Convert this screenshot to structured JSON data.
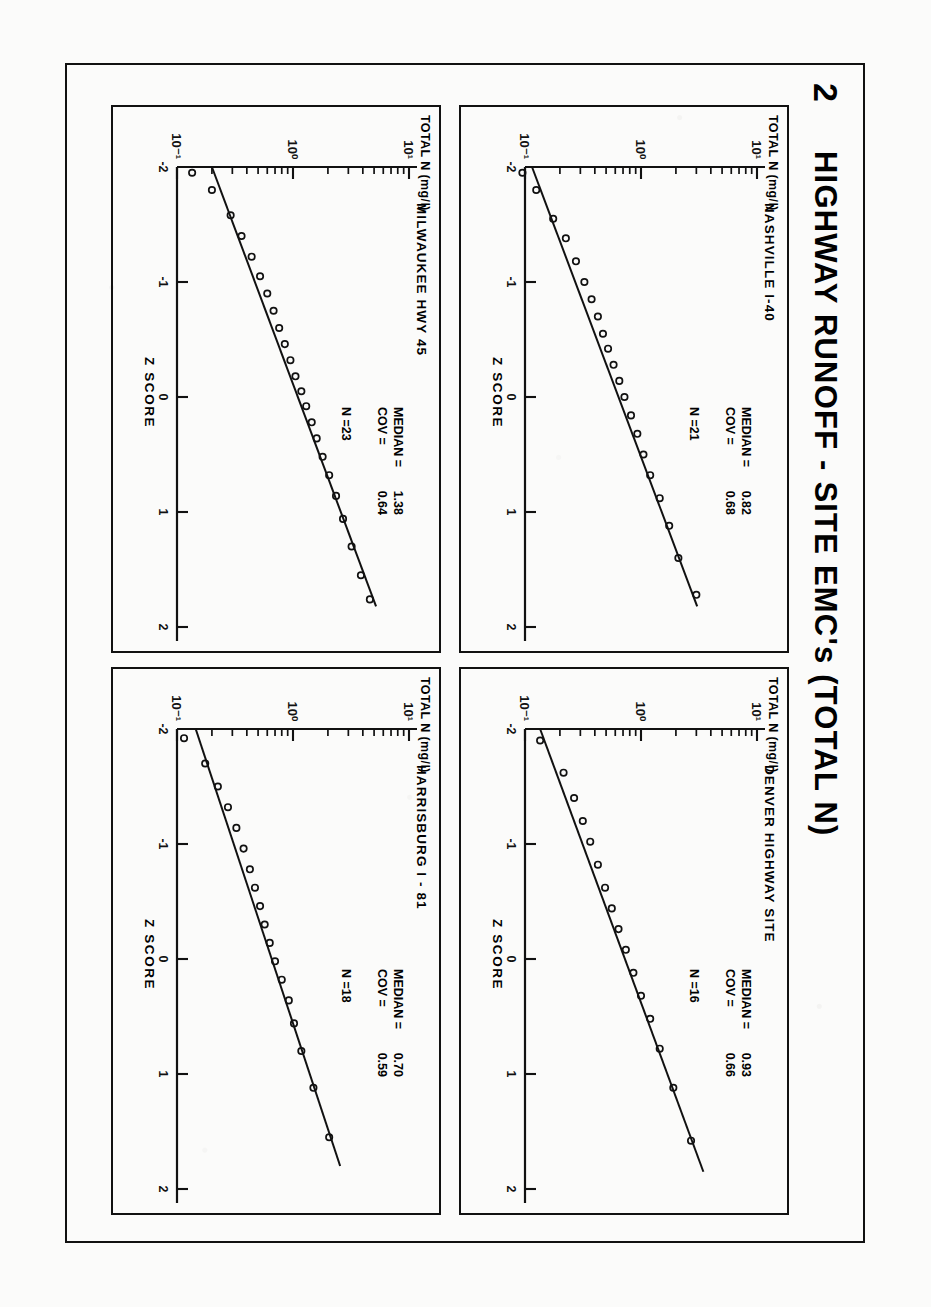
{
  "figure": {
    "number": "2",
    "title": "HIGHWAY RUNOFF  -  SITE EMC's   (TOTAL N)"
  },
  "axes": {
    "y_title": "TOTAL N",
    "y_units": "(mg/l)",
    "y_ticklabels": [
      "10¹",
      "10⁰",
      "10⁻¹"
    ],
    "x_title": "Z  SCORE",
    "x_ticklabels": [
      "-2",
      "-1",
      "0",
      "1",
      "2"
    ],
    "x_range": [
      -2,
      2
    ],
    "y_range_log10": [
      -1,
      1
    ],
    "y_scale": "log",
    "labels": {
      "median": "MEDIAN  =",
      "cov": "COV   =",
      "n_prefix": "N ="
    }
  },
  "panels": [
    {
      "id": "nashville",
      "position": "top-left-of-plate",
      "site": "NASHVILLE  I-40",
      "median": "0.82",
      "cov": "0.68",
      "n": "21",
      "chart_data": {
        "type": "scatter",
        "title": "NASHVILLE  I-40",
        "xlabel": "Z  SCORE",
        "ylabel": "TOTAL N (mg/l)",
        "xlim": [
          -2,
          2
        ],
        "ylim": [
          0.1,
          10
        ],
        "yscale": "log",
        "grid": false,
        "legend": null,
        "median": 0.82,
        "cov": 0.68,
        "n": 21,
        "fit_line": {
          "x": [
            -2.0,
            1.82
          ],
          "y": [
            0.115,
            3.05
          ]
        },
        "x": [
          -1.95,
          -1.8,
          -1.55,
          -1.38,
          -1.18,
          -1.0,
          -0.85,
          -0.7,
          -0.55,
          -0.42,
          -0.28,
          -0.14,
          0.0,
          0.16,
          0.32,
          0.5,
          0.68,
          0.88,
          1.12,
          1.4,
          1.72
        ],
        "y": [
          0.095,
          0.125,
          0.175,
          0.225,
          0.275,
          0.325,
          0.375,
          0.425,
          0.47,
          0.52,
          0.58,
          0.65,
          0.72,
          0.82,
          0.93,
          1.05,
          1.2,
          1.45,
          1.75,
          2.1,
          3.0
        ]
      }
    },
    {
      "id": "denver",
      "position": "top-right-of-plate",
      "site": "DENVER  HIGHWAY  SITE",
      "median": "0.93",
      "cov": "0.66",
      "n": "16",
      "chart_data": {
        "type": "scatter",
        "title": "DENVER HIGHWAY SITE",
        "xlabel": "Z  SCORE",
        "ylabel": "TOTAL N (mg/l)",
        "xlim": [
          -2,
          2
        ],
        "ylim": [
          0.1,
          10
        ],
        "yscale": "log",
        "grid": false,
        "legend": null,
        "median": 0.93,
        "cov": 0.66,
        "n": 16,
        "fit_line": {
          "x": [
            -2.0,
            1.85
          ],
          "y": [
            0.135,
            3.45
          ]
        },
        "x": [
          -1.9,
          -1.62,
          -1.4,
          -1.2,
          -1.02,
          -0.82,
          -0.62,
          -0.44,
          -0.26,
          -0.08,
          0.12,
          0.32,
          0.52,
          0.78,
          1.12,
          1.58
        ],
        "y": [
          0.135,
          0.215,
          0.265,
          0.315,
          0.365,
          0.425,
          0.49,
          0.56,
          0.64,
          0.74,
          0.86,
          1.0,
          1.2,
          1.45,
          1.9,
          2.7
        ]
      }
    },
    {
      "id": "milwaukee",
      "position": "bottom-left-of-plate",
      "site": "MILWAUKEE  HWY  45",
      "median": "1.38",
      "cov": "0.64",
      "n": "23",
      "chart_data": {
        "type": "scatter",
        "title": "MILWAUKEE HWY 45",
        "xlabel": "Z  SCORE",
        "ylabel": "TOTAL N (mg/l)",
        "xlim": [
          -2,
          2
        ],
        "ylim": [
          0.1,
          10
        ],
        "yscale": "log",
        "grid": false,
        "legend": null,
        "median": 1.38,
        "cov": 0.64,
        "n": 23,
        "fit_line": {
          "x": [
            -2.0,
            1.82
          ],
          "y": [
            0.2,
            5.2
          ]
        },
        "x": [
          -1.95,
          -1.8,
          -1.58,
          -1.4,
          -1.22,
          -1.05,
          -0.9,
          -0.75,
          -0.6,
          -0.46,
          -0.32,
          -0.18,
          -0.05,
          0.08,
          0.22,
          0.36,
          0.52,
          0.68,
          0.86,
          1.06,
          1.3,
          1.55,
          1.76
        ],
        "y": [
          0.135,
          0.2,
          0.29,
          0.36,
          0.44,
          0.52,
          0.6,
          0.68,
          0.76,
          0.85,
          0.95,
          1.05,
          1.18,
          1.3,
          1.45,
          1.6,
          1.8,
          2.05,
          2.35,
          2.7,
          3.2,
          3.85,
          4.6
        ]
      }
    },
    {
      "id": "harrisburg",
      "position": "bottom-right-of-plate",
      "site": "HARRISBURG  I - 81",
      "median": "0.70",
      "cov": "0.59",
      "n": "18",
      "chart_data": {
        "type": "scatter",
        "title": "HARRISBURG I-81",
        "xlabel": "Z  SCORE",
        "ylabel": "TOTAL N (mg/l)",
        "xlim": [
          -2,
          2
        ],
        "ylim": [
          0.1,
          10
        ],
        "yscale": "log",
        "grid": false,
        "legend": null,
        "median": 0.7,
        "cov": 0.59,
        "n": 18,
        "fit_line": {
          "x": [
            -2.0,
            1.8
          ],
          "y": [
            0.145,
            2.55
          ]
        },
        "x": [
          -1.92,
          -1.7,
          -1.5,
          -1.32,
          -1.14,
          -0.96,
          -0.78,
          -0.62,
          -0.46,
          -0.3,
          -0.14,
          0.02,
          0.18,
          0.36,
          0.56,
          0.8,
          1.12,
          1.55
        ],
        "y": [
          0.115,
          0.175,
          0.225,
          0.275,
          0.325,
          0.375,
          0.425,
          0.47,
          0.52,
          0.57,
          0.63,
          0.7,
          0.8,
          0.92,
          1.02,
          1.18,
          1.5,
          2.05
        ]
      }
    }
  ]
}
